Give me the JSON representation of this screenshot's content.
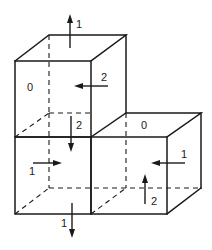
{
  "diagram": {
    "cubes": [
      {
        "id": "top",
        "face_label": "0"
      },
      {
        "id": "bottom-left"
      },
      {
        "id": "bottom-right",
        "face_label": "0"
      }
    ],
    "labels": {
      "top_cube_left_face": "0",
      "top_cube_up_arrow": "1",
      "top_cube_right_arrow": "2",
      "bottom_left_top_arrow": "2",
      "bottom_left_left_arrow": "1",
      "bottom_left_down_arrow": "1",
      "bottom_right_top_face": "0",
      "bottom_right_right_arrow": "1",
      "bottom_right_up_arrow": "2"
    },
    "colors": {
      "line": "#1a1a1a",
      "background": "#ffffff"
    }
  }
}
